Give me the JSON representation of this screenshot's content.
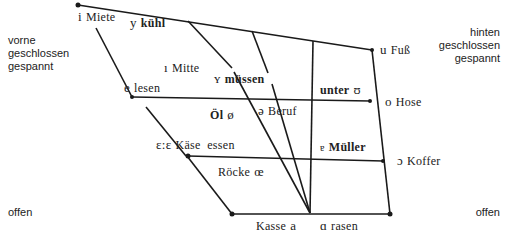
{
  "axis_labels": {
    "top_left": [
      "vorne",
      "geschlossen",
      "gespannt"
    ],
    "top_right": [
      "hinten",
      "geschlossen",
      "gespannt"
    ],
    "bottom_left": "offen",
    "bottom_right": "offen"
  },
  "vowels": {
    "i": {
      "ipa": "i",
      "example": "Miete"
    },
    "y": {
      "ipa": "y",
      "example": "kühl"
    },
    "u": {
      "ipa": "u",
      "example": "Fuß"
    },
    "I": {
      "ipa": "ı",
      "example": "Mitte"
    },
    "Y": {
      "ipa": "ʏ",
      "example": "müssen"
    },
    "U": {
      "ipa": "ʊ",
      "example": "unter"
    },
    "e": {
      "ipa": "e",
      "example": "lesen"
    },
    "o": {
      "ipa": "o",
      "example": "Hose"
    },
    "oe": {
      "ipa": "ø",
      "example": "Öl"
    },
    "schwa": {
      "ipa": "ə",
      "example": "Beruf"
    },
    "E": {
      "ipa": "ɛ:ɛ",
      "example": "Käse  essen"
    },
    "O": {
      "ipa": "ɔ",
      "example": "Koffer"
    },
    "er": {
      "ipa": "ɐ",
      "example": "Müller"
    },
    "OE": {
      "ipa": "œ",
      "example": "Röcke"
    },
    "a": {
      "ipa": "a",
      "example": "Kasse"
    },
    "A": {
      "ipa": "ɑ",
      "example": "rasen"
    }
  },
  "colors": {
    "line": "#1a1a1a",
    "text": "#222222"
  }
}
